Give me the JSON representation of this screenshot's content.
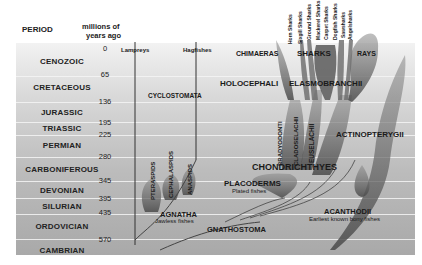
{
  "header": {
    "period_label": "PERIOD",
    "mya_label_line1": "millions of",
    "mya_label_line2": "years ago"
  },
  "periods": [
    {
      "name": "CENOZOIC",
      "start_mya": 0,
      "end_mya": 65
    },
    {
      "name": "CRETACEOUS",
      "start_mya": 65,
      "end_mya": 136
    },
    {
      "name": "JURASSIC",
      "start_mya": 136,
      "end_mya": 195
    },
    {
      "name": "TRIASSIC",
      "start_mya": 195,
      "end_mya": 225
    },
    {
      "name": "PERMIAN",
      "start_mya": 225,
      "end_mya": 280
    },
    {
      "name": "CARBONIFEROUS",
      "start_mya": 280,
      "end_mya": 345
    },
    {
      "name": "DEVONIAN",
      "start_mya": 345,
      "end_mya": 395
    },
    {
      "name": "SILURIAN",
      "start_mya": 395,
      "end_mya": 435
    },
    {
      "name": "ORDOVICIAN",
      "start_mya": 435,
      "end_mya": 570
    },
    {
      "name": "CAMBRIAN",
      "start_mya": 570,
      "end_mya": null
    }
  ],
  "ticks": [
    "0",
    "65",
    "136",
    "195",
    "225",
    "280",
    "345",
    "395",
    "435",
    "570"
  ],
  "groups": {
    "lampreys": "Lampreys",
    "hagfishes": "Hagfishes",
    "cyclostomata": "CYCLOSTOMATA",
    "pteraspids": "PTERASPIDS",
    "cephalaspids": "CEPHALASPIDS",
    "anaspids": "ANASPIDS",
    "agnatha": "AGNATHA",
    "agnatha_sub": "Jawless fishes",
    "gnathostoma": "GNATHOSTOMA",
    "placoderms": "PLACODERMS",
    "placoderms_sub": "Plated fishes",
    "chondrichthyes": "CHONDRICHTHYES",
    "bradyodonti": "BRADYODONTI",
    "cladoselachii": "CLADOSELACHII",
    "euselachii": "EUSELACHII",
    "holocephali": "HOLOCEPHALI",
    "elasmobranchii": "ELASMOBRANCHII",
    "chimaeras": "CHIMAERAS",
    "sharks": "SHARKS",
    "rays": "RAYS",
    "actinopterygii": "ACTINOPTERYGII",
    "acanthodii": "ACANTHODII",
    "acanthodii_sub": "Earliest known bony fishes"
  },
  "shark_orders": [
    "Horn Sharks",
    "Sixgill Sharks",
    "Ground Sharks",
    "Mackerel Sharks",
    "Carpet Sharks",
    "Dogfish Sharks",
    "Sawsharks",
    "Angelsharks"
  ]
}
